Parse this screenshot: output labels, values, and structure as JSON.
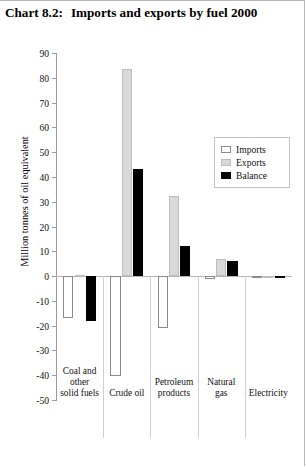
{
  "title": {
    "label": "Chart 8.2:",
    "text": "Imports and exports by fuel 2000"
  },
  "chart_data": {
    "type": "bar",
    "title": "Chart 8.2: Imports and exports by fuel 2000",
    "xlabel": "",
    "ylabel": "Million tonnes of oil equivalent",
    "ylim": [
      -50,
      90
    ],
    "ytick_step": 10,
    "yticks": [
      90,
      80,
      70,
      60,
      50,
      40,
      30,
      20,
      10,
      0,
      -10,
      -20,
      -30,
      -40,
      -50
    ],
    "ytick_labels": [
      "90",
      "80",
      "70",
      "60",
      "50",
      "40",
      "30",
      "20",
      "10",
      "0",
      "-10",
      "-20",
      "-30",
      "-40",
      "-50"
    ],
    "grid": false,
    "legend_position": "upper right",
    "categories": [
      "Coal and other solid fuels",
      "Crude oil",
      "Petroleum products",
      "Natural gas",
      "Electricity"
    ],
    "category_lines": [
      [
        "Coal and",
        "other",
        "solid fuels"
      ],
      [
        "Crude oil"
      ],
      [
        "Petroleum",
        "products"
      ],
      [
        "Natural",
        "gas"
      ],
      [
        "Electricity"
      ]
    ],
    "series": [
      {
        "name": "Imports",
        "color": "#ffffff",
        "edge_color": "#8a8a8a",
        "values": [
          -17.0,
          -40.5,
          -21.0,
          -1.0,
          -0.7
        ]
      },
      {
        "name": "Exports",
        "color": "#d9d9d9",
        "edge_color": "#bdbdbd",
        "values": [
          0.5,
          83.5,
          32.5,
          7.0,
          0.2
        ]
      },
      {
        "name": "Balance",
        "color": "#000000",
        "edge_color": "#000000",
        "values": [
          -18.0,
          43.0,
          12.0,
          6.0,
          -0.8
        ]
      }
    ]
  },
  "legend": {
    "items": [
      {
        "label": "Imports"
      },
      {
        "label": "Exports"
      },
      {
        "label": "Balance"
      }
    ]
  }
}
